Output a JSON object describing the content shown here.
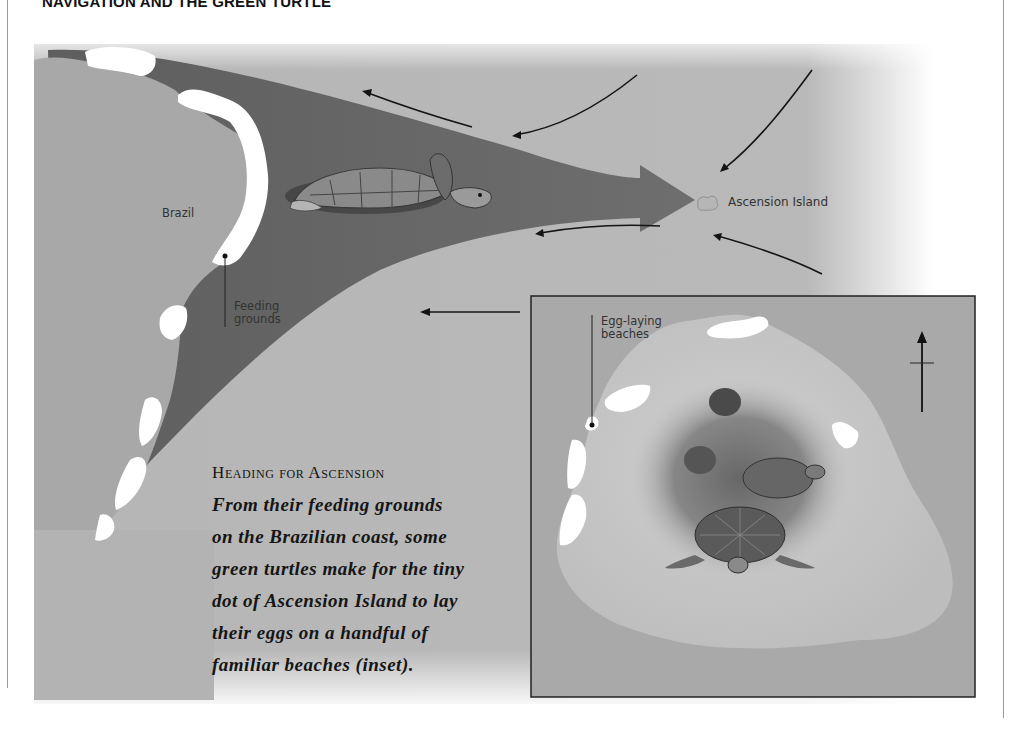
{
  "page": {
    "title": "NAVIGATION AND THE GREEN TURTLE"
  },
  "map": {
    "labels": {
      "country": "Brazil",
      "feeding": [
        "Feeding",
        "grounds"
      ],
      "island": "Ascension Island"
    },
    "colors": {
      "ocean": "#b4b4b4",
      "land": "#a9a9a9",
      "migration_path": "#6a6a6a",
      "beach": "#ffffff",
      "ink": "#1a1a1a"
    }
  },
  "inset": {
    "labels": {
      "beaches": [
        "Egg-laying",
        "beaches"
      ]
    },
    "compass": "north-arrow"
  },
  "caption": {
    "heading": "Heading for Ascension",
    "lines": [
      "From their feeding grounds",
      "on the Brazilian coast, some",
      "green turtles make for the tiny",
      "dot of Ascension Island to lay",
      "their eggs on a handful of",
      "familiar beaches (inset)."
    ]
  }
}
